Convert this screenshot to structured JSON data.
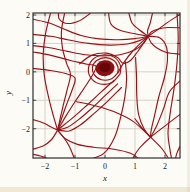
{
  "chart_data": {
    "type": "line",
    "subtype": "phase-portrait-streamlines",
    "title": "",
    "xlabel": "x",
    "ylabel": "y",
    "xlim": [
      -2.4,
      2.5
    ],
    "ylim": [
      -3.03,
      2.07
    ],
    "grid": true,
    "x_ticks": [
      -2,
      -1,
      0,
      1,
      2
    ],
    "y_ticks": [
      -2,
      -1,
      0,
      1,
      2
    ],
    "x_tick_labels": [
      "−2",
      "−1",
      "0",
      "1",
      "2"
    ],
    "y_tick_labels": [
      "−2",
      "−1",
      "0",
      "1",
      "2"
    ],
    "colors": {
      "stream": "#9a1115",
      "blob_fill": "#8a1014",
      "blob_core": "#650709",
      "grid": "#ccc8bb",
      "frame": "#2d2d2d",
      "tick": "#222222",
      "label": "#1a1a1a",
      "background": "#fcfbf6"
    },
    "equilibria": [
      {
        "type": "spiral-sink",
        "position": [
          0.0,
          0.12
        ]
      },
      {
        "type": "pinwheel-sink",
        "position": [
          1.44,
          1.25
        ]
      },
      {
        "type": "pinwheel-sink",
        "position": [
          -1.58,
          -2.05
        ]
      },
      {
        "type": "saddle",
        "position": [
          1.52,
          -2.3
        ]
      },
      {
        "type": "cusp",
        "position": [
          0.43,
          -0.03
        ]
      }
    ],
    "blob": {
      "center": [
        0.0,
        0.13
      ],
      "rx": 0.32,
      "ry": 0.28,
      "core_rx": 0.19,
      "core_ry": 0.16
    },
    "streamlines": [
      [
        [
          -0.5,
          2.05
        ],
        [
          -0.85,
          1.8
        ],
        [
          -1.25,
          1.7
        ],
        [
          -1.52,
          1.85
        ],
        [
          -1.55,
          2.05
        ]
      ],
      [
        [
          -2.4,
          1.85
        ],
        [
          -1.85,
          1.72
        ],
        [
          -1.35,
          1.5
        ],
        [
          -0.8,
          1.28
        ],
        [
          -0.2,
          1.16
        ],
        [
          0.45,
          1.13
        ],
        [
          1.0,
          1.17
        ],
        [
          1.44,
          1.25
        ]
      ],
      [
        [
          -2.4,
          1.32
        ],
        [
          -1.8,
          1.25
        ],
        [
          -1.2,
          1.12
        ],
        [
          -0.55,
          1.0
        ],
        [
          0.15,
          0.94
        ],
        [
          0.75,
          0.98
        ],
        [
          1.15,
          1.1
        ],
        [
          1.44,
          1.25
        ]
      ],
      [
        [
          -2.4,
          0.92
        ],
        [
          -1.85,
          0.85
        ],
        [
          -1.25,
          0.72
        ],
        [
          -0.65,
          0.6
        ],
        [
          -0.08,
          0.56
        ],
        [
          0.5,
          0.6
        ],
        [
          1.0,
          0.78
        ],
        [
          1.28,
          1.0
        ],
        [
          1.44,
          1.25
        ]
      ],
      [
        [
          -0.85,
          0.28
        ],
        [
          -0.45,
          0.58
        ],
        [
          0.05,
          0.66
        ],
        [
          0.42,
          0.5
        ],
        [
          0.6,
          0.3
        ],
        [
          0.85,
          0.4
        ],
        [
          1.08,
          0.7
        ],
        [
          1.28,
          1.0
        ],
        [
          1.44,
          1.25
        ]
      ],
      [
        [
          0.12,
          2.05
        ],
        [
          0.2,
          1.68
        ],
        [
          0.5,
          1.46
        ],
        [
          0.95,
          1.35
        ],
        [
          1.44,
          1.25
        ]
      ],
      [
        [
          0.8,
          2.05
        ],
        [
          0.9,
          1.72
        ],
        [
          1.12,
          1.5
        ],
        [
          1.44,
          1.25
        ]
      ],
      [
        [
          1.58,
          2.05
        ],
        [
          1.5,
          1.7
        ],
        [
          1.42,
          1.45
        ],
        [
          1.44,
          1.25
        ]
      ],
      [
        [
          2.5,
          2.02
        ],
        [
          2.1,
          1.75
        ],
        [
          1.75,
          1.48
        ],
        [
          1.44,
          1.25
        ]
      ],
      [
        [
          2.5,
          1.55
        ],
        [
          2.1,
          1.56
        ],
        [
          1.76,
          1.5
        ],
        [
          1.54,
          1.4
        ],
        [
          1.44,
          1.25
        ]
      ],
      [
        [
          2.5,
          0.62
        ],
        [
          2.05,
          0.68
        ],
        [
          1.72,
          0.85
        ],
        [
          1.54,
          1.02
        ],
        [
          1.44,
          1.25
        ]
      ],
      [
        [
          1.44,
          1.25
        ],
        [
          1.18,
          1.0
        ],
        [
          0.9,
          0.7
        ],
        [
          0.65,
          0.36
        ],
        [
          0.43,
          -0.03
        ]
      ],
      [
        [
          -2.4,
          0.7
        ],
        [
          -1.8,
          0.58
        ],
        [
          -1.15,
          0.4
        ],
        [
          -0.6,
          0.27
        ],
        [
          -0.3,
          0.2
        ],
        [
          -0.42,
          -0.12
        ],
        [
          -0.68,
          -0.55
        ],
        [
          -1.0,
          -1.05
        ],
        [
          -1.3,
          -1.55
        ],
        [
          -1.58,
          -2.05
        ]
      ],
      [
        [
          -2.4,
          0.12
        ],
        [
          -1.85,
          0.05
        ],
        [
          -1.35,
          -0.05
        ],
        [
          -1.0,
          -0.22
        ],
        [
          -1.1,
          -0.65
        ],
        [
          -1.3,
          -1.2
        ],
        [
          -1.45,
          -1.65
        ],
        [
          -1.58,
          -2.05
        ]
      ],
      [
        [
          -1.82,
          2.05
        ],
        [
          -1.98,
          1.35
        ],
        [
          -2.06,
          0.6
        ],
        [
          -2.02,
          -0.15
        ],
        [
          -1.88,
          -0.9
        ],
        [
          -1.72,
          -1.55
        ],
        [
          -1.58,
          -2.05
        ]
      ],
      [
        [
          -1.35,
          2.05
        ],
        [
          -1.45,
          1.45
        ],
        [
          -1.42,
          0.85
        ],
        [
          -1.28,
          0.3
        ],
        [
          -1.15,
          -0.1
        ],
        [
          -1.28,
          -0.7
        ],
        [
          -1.42,
          -1.3
        ],
        [
          -1.58,
          -2.05
        ]
      ],
      [
        [
          0.3,
          -0.3
        ],
        [
          -0.1,
          -0.68
        ],
        [
          -0.55,
          -1.12
        ],
        [
          -1.0,
          -1.55
        ],
        [
          -1.35,
          -1.85
        ],
        [
          -1.58,
          -2.05
        ]
      ],
      [
        [
          0.42,
          -0.42
        ],
        [
          0.02,
          -0.82
        ],
        [
          -0.42,
          -1.26
        ],
        [
          -0.88,
          -1.68
        ],
        [
          -1.25,
          -1.95
        ],
        [
          -1.58,
          -2.05
        ]
      ],
      [
        [
          0.55,
          -0.55
        ],
        [
          0.12,
          -1.0
        ],
        [
          -0.35,
          -1.45
        ],
        [
          -0.8,
          -1.85
        ],
        [
          -1.2,
          -2.08
        ],
        [
          -1.58,
          -2.05
        ]
      ],
      [
        [
          -2.4,
          -1.68
        ],
        [
          -2.05,
          -1.8
        ],
        [
          -1.78,
          -1.95
        ],
        [
          -1.58,
          -2.05
        ]
      ],
      [
        [
          -2.4,
          -2.72
        ],
        [
          -2.05,
          -2.6
        ],
        [
          -1.78,
          -2.38
        ],
        [
          -1.58,
          -2.05
        ]
      ],
      [
        [
          -1.02,
          -3.05
        ],
        [
          -1.2,
          -2.6
        ],
        [
          -1.4,
          -2.28
        ],
        [
          -1.58,
          -2.05
        ]
      ],
      [
        [
          -2.4,
          -2.9
        ],
        [
          -2.15,
          -2.96
        ],
        [
          -1.92,
          -3.05
        ]
      ],
      [
        [
          -1.58,
          -2.05
        ],
        [
          -1.32,
          -2.35
        ],
        [
          -0.92,
          -2.55
        ],
        [
          -0.38,
          -2.65
        ],
        [
          0.3,
          -2.72
        ],
        [
          0.85,
          -2.86
        ],
        [
          1.12,
          -3.05
        ]
      ],
      [
        [
          0.68,
          0.35
        ],
        [
          0.72,
          -0.25
        ],
        [
          0.66,
          -0.9
        ],
        [
          0.52,
          -1.6
        ],
        [
          0.32,
          -2.3
        ],
        [
          -0.02,
          -2.85
        ],
        [
          -0.42,
          -3.05
        ]
      ],
      [
        [
          1.02,
          0.5
        ],
        [
          1.05,
          -0.15
        ],
        [
          1.06,
          -0.85
        ],
        [
          1.12,
          -1.5
        ],
        [
          1.3,
          -2.0
        ],
        [
          1.52,
          -2.3
        ]
      ],
      [
        [
          -0.95,
          -1.05
        ],
        [
          -0.3,
          -1.2
        ],
        [
          0.35,
          -1.42
        ],
        [
          0.95,
          -1.75
        ],
        [
          1.52,
          -2.3
        ]
      ],
      [
        [
          1.44,
          1.25
        ],
        [
          1.82,
          1.2
        ],
        [
          2.04,
          0.9
        ],
        [
          2.08,
          0.4
        ],
        [
          1.98,
          -0.2
        ],
        [
          1.8,
          -0.85
        ],
        [
          1.65,
          -1.55
        ],
        [
          1.54,
          -2.05
        ],
        [
          1.52,
          -2.3
        ]
      ],
      [
        [
          2.5,
          -0.32
        ],
        [
          2.15,
          -0.7
        ],
        [
          1.95,
          -1.3
        ],
        [
          1.72,
          -1.9
        ],
        [
          1.52,
          -2.3
        ]
      ],
      [
        [
          2.5,
          -1.5
        ],
        [
          2.1,
          -1.82
        ],
        [
          1.52,
          -2.3
        ],
        [
          1.15,
          -2.68
        ],
        [
          0.92,
          -3.05
        ]
      ],
      [
        [
          1.0,
          -1.65
        ],
        [
          1.25,
          -2.0
        ],
        [
          1.52,
          -2.3
        ],
        [
          1.88,
          -2.68
        ],
        [
          2.12,
          -3.05
        ]
      ],
      [
        [
          2.4,
          2.05
        ],
        [
          2.44,
          1.2
        ],
        [
          2.4,
          0.3
        ],
        [
          2.3,
          -0.6
        ],
        [
          2.18,
          -1.4
        ],
        [
          2.1,
          -2.15
        ],
        [
          2.16,
          -2.7
        ],
        [
          2.22,
          -3.05
        ]
      ],
      [
        [
          2.5,
          -2.62
        ],
        [
          2.4,
          -2.85
        ],
        [
          2.35,
          -3.05
        ]
      ],
      [
        [
          0.43,
          -0.03
        ],
        [
          0.2,
          -0.25
        ],
        [
          -0.12,
          -0.28
        ],
        [
          -0.36,
          -0.1
        ],
        [
          -0.42,
          0.16
        ],
        [
          -0.28,
          0.4
        ],
        [
          0.02,
          0.5
        ],
        [
          0.3,
          0.4
        ],
        [
          0.43,
          0.18
        ],
        [
          0.43,
          -0.03
        ]
      ],
      [
        [
          0.5,
          -0.08
        ],
        [
          0.22,
          -0.38
        ],
        [
          -0.18,
          -0.42
        ],
        [
          -0.48,
          -0.2
        ],
        [
          -0.55,
          0.14
        ],
        [
          -0.38,
          0.46
        ],
        [
          -0.02,
          0.6
        ],
        [
          0.33,
          0.5
        ],
        [
          0.52,
          0.2
        ],
        [
          0.5,
          -0.08
        ]
      ]
    ]
  }
}
